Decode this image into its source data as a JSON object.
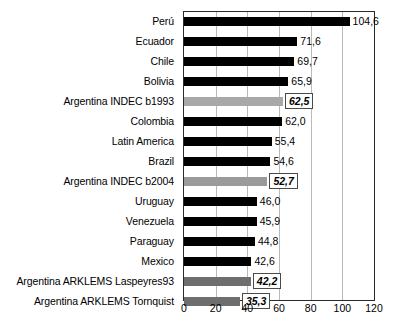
{
  "chart_data": {
    "type": "bar",
    "orientation": "horizontal",
    "title": "",
    "xlabel": "",
    "ylabel": "",
    "xlim": [
      0,
      120
    ],
    "xticks": [
      0,
      20,
      40,
      60,
      80,
      100,
      120
    ],
    "xtick_labels": [
      "0",
      "20",
      "40",
      "60",
      "80",
      "100",
      "120"
    ],
    "grid": true,
    "grid_axis": "x",
    "legend": "none",
    "decimal_separator": ",",
    "categories": [
      "Perú",
      "Ecuador",
      "Chile",
      "Bolivia",
      "Argentina INDEC b1993",
      "Colombia",
      "Latin America",
      "Brazil",
      "Argentina INDEC b2004",
      "Uruguay",
      "Venezuela",
      "Paraguay",
      "Mexico",
      "Argentina ARKLEMS Laspeyres93",
      "Argentina ARKLEMS Tornquist"
    ],
    "values": [
      104.6,
      71.6,
      69.7,
      65.9,
      62.5,
      62.0,
      55.4,
      54.6,
      52.7,
      46.0,
      45.9,
      44.8,
      42.6,
      42.2,
      35.3
    ],
    "value_labels": [
      "104,6",
      "71,6",
      "69,7",
      "65,9",
      "62,5",
      "62,0",
      "55,4",
      "54,6",
      "52,7",
      "46,0",
      "45,9",
      "44,8",
      "42,6",
      "42,2",
      "35,3"
    ],
    "bar_styles": [
      "black",
      "black",
      "black",
      "black",
      "light",
      "black",
      "black",
      "black",
      "medium",
      "black",
      "black",
      "black",
      "black",
      "dark",
      "dark"
    ],
    "label_boxed": [
      false,
      false,
      false,
      false,
      true,
      false,
      false,
      false,
      true,
      false,
      false,
      false,
      false,
      true,
      true
    ],
    "colors": {
      "bar_black": "#000000",
      "bar_light": "#a8a8a8",
      "bar_medium": "#9a9a9a",
      "bar_dark": "#6e6e6e",
      "axis": "#2b2b2b",
      "gridline": "#b9b9b9",
      "text": "#000000",
      "background": "#ffffff"
    }
  }
}
